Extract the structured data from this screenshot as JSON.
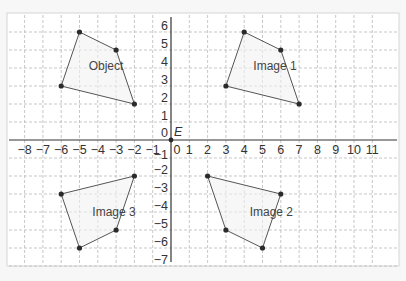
{
  "diagram": {
    "type": "coordinate-grid-transformations",
    "x_axis": {
      "min": -8,
      "max": 11,
      "tick_labels": [
        "−8",
        "−7",
        "−6",
        "−5",
        "−4",
        "−3",
        "−2",
        "−1",
        "0",
        "1",
        "2",
        "3",
        "4",
        "5",
        "6",
        "7",
        "8",
        "9",
        "10",
        "11"
      ]
    },
    "y_axis": {
      "min": -7,
      "max": 6,
      "tick_labels": [
        "6",
        "5",
        "4",
        "3",
        "2",
        "1",
        "0",
        "−1",
        "−2",
        "−3",
        "−4",
        "−5",
        "−6",
        "−7"
      ]
    },
    "origin_label": "E",
    "shapes": [
      {
        "name": "object",
        "label": "Object",
        "vertices": [
          [
            -5,
            6
          ],
          [
            -3,
            5
          ],
          [
            -2,
            2
          ],
          [
            -6,
            3
          ]
        ],
        "label_pos": [
          -4.5,
          3.9
        ]
      },
      {
        "name": "image-1",
        "label": "Image 1",
        "vertices": [
          [
            4,
            6
          ],
          [
            6,
            5
          ],
          [
            7,
            2
          ],
          [
            3,
            3
          ]
        ],
        "label_pos": [
          4.5,
          3.9
        ]
      },
      {
        "name": "image-2",
        "label": "Image 2",
        "vertices": [
          [
            2,
            -2
          ],
          [
            6,
            -3
          ],
          [
            5,
            -6
          ],
          [
            3,
            -5
          ]
        ],
        "label_pos": [
          4.3,
          -4.2
        ]
      },
      {
        "name": "image-3",
        "label": "Image 3",
        "vertices": [
          [
            -2,
            -2
          ],
          [
            -6,
            -3
          ],
          [
            -5,
            -6
          ],
          [
            -3,
            -5
          ]
        ],
        "label_pos": [
          -4.3,
          -4.2
        ]
      }
    ],
    "colors": {
      "grid": "#b9b9b9",
      "axis": "#333333",
      "shape_stroke": "#555555",
      "vertex": "#2b2b2b"
    }
  }
}
